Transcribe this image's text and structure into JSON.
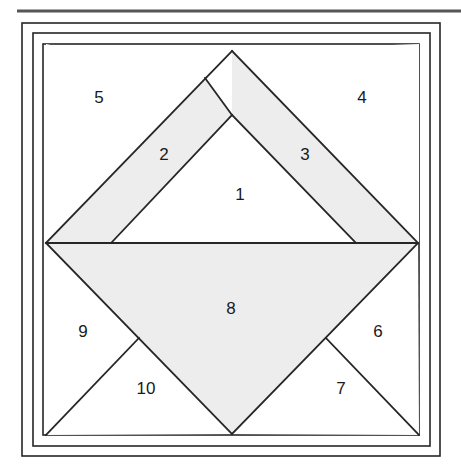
{
  "figure": {
    "type": "quilt-block-piecing-diagram",
    "canvas": {
      "width": 461,
      "height": 474
    },
    "colors": {
      "line": "#262626",
      "shaded_fill": "#ededed",
      "plain_fill": "#ffffff",
      "background": "#ffffff",
      "rule": "#555555"
    },
    "top_rule": {
      "x1": 17,
      "y1": 11,
      "x2": 461,
      "y2": 11,
      "thickness": 3
    },
    "frames": [
      {
        "name": "outer-frame",
        "x": 22,
        "y": 23,
        "width": 418,
        "height": 433
      },
      {
        "name": "middle-frame",
        "x": 33,
        "y": 33,
        "width": 397,
        "height": 413
      },
      {
        "name": "inner-frame",
        "x": 43,
        "y": 44,
        "width": 376,
        "height": 391
      }
    ],
    "anchors": {
      "block_left": 46,
      "block_right": 418,
      "block_top": 47,
      "block_bottom": 434,
      "center_x": 232,
      "mid_y": 243,
      "diamond_apex": [
        232,
        51
      ],
      "diamond_left": [
        46,
        243
      ],
      "diamond_right": [
        418,
        243
      ],
      "diamond_bottom": [
        232,
        434
      ],
      "tri1_apex": [
        232,
        115
      ],
      "tri1_base_left": [
        112,
        242
      ],
      "tri1_base_right": [
        355,
        242
      ],
      "seam_upper_left": [
        205,
        78
      ],
      "seam_lower_left": [
        139,
        338
      ],
      "seam_lower_right": [
        326,
        338
      ]
    },
    "pieces": [
      {
        "number": "1",
        "shade": "plain",
        "points": "112,242 355,242 232,115",
        "label_x": 240,
        "label_y": 196
      },
      {
        "number": "2",
        "shade": "shaded",
        "points": "46,243 205,78 232,115 112,242",
        "label_x": 164,
        "label_y": 156
      },
      {
        "number": "3",
        "shade": "shaded",
        "points": "232,115 232,51 418,243 355,242",
        "label_x": 305,
        "label_y": 156
      },
      {
        "number": "4",
        "shade": "plain",
        "points": "232,51 419,44 419,243 418,243",
        "label_x": 362,
        "label_y": 99
      },
      {
        "number": "5",
        "shade": "plain",
        "points": "46,44 205,78 46,243",
        "label_x": 99,
        "label_y": 99
      },
      {
        "number": "6",
        "shade": "plain",
        "points": "418,243 419,435 326,338",
        "label_x": 378,
        "label_y": 333
      },
      {
        "number": "7",
        "shade": "plain",
        "points": "326,338 419,435 232,434",
        "label_x": 341,
        "label_y": 390
      },
      {
        "number": "8",
        "shade": "shaded",
        "points": "46,243 418,243 232,434",
        "label_x": 231,
        "label_y": 310
      },
      {
        "number": "9",
        "shade": "plain",
        "points": "46,243 139,338 46,435",
        "label_x": 83,
        "label_y": 333
      },
      {
        "number": "10",
        "shade": "plain",
        "points": "139,338 232,434 46,435",
        "label_x": 146,
        "label_y": 390
      }
    ],
    "seam_lines": [
      {
        "name": "diamond-upper-left",
        "x1": 46,
        "y1": 243,
        "x2": 232,
        "y2": 51
      },
      {
        "name": "diamond-upper-right",
        "x1": 232,
        "y1": 51,
        "x2": 418,
        "y2": 243
      },
      {
        "name": "diamond-lower-left",
        "x1": 46,
        "y1": 243,
        "x2": 232,
        "y2": 434
      },
      {
        "name": "diamond-lower-right",
        "x1": 232,
        "y1": 434,
        "x2": 418,
        "y2": 243
      },
      {
        "name": "horizontal-center",
        "x1": 46,
        "y1": 243,
        "x2": 418,
        "y2": 243
      },
      {
        "name": "tri1-left-seam",
        "x1": 112,
        "y1": 242,
        "x2": 232,
        "y2": 115
      },
      {
        "name": "tri1-right-seam",
        "x1": 232,
        "y1": 115,
        "x2": 355,
        "y2": 242
      },
      {
        "name": "seam-2-5",
        "x1": 205,
        "y1": 78,
        "x2": 232,
        "y2": 115
      },
      {
        "name": "seam-9-10",
        "x1": 139,
        "y1": 338,
        "x2": 46,
        "y2": 435
      },
      {
        "name": "seam-6-7",
        "x1": 326,
        "y1": 338,
        "x2": 419,
        "y2": 435
      }
    ]
  }
}
